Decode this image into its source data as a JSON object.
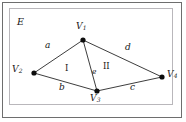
{
  "figure": {
    "region_label": "E",
    "background_color": "#ffffff",
    "line_color": "#1a1a1a",
    "outer_border_color": "#6e6e6e",
    "inner_border_color": "#b9b7bb"
  },
  "vertices": [
    {
      "id": "v1",
      "label": "V",
      "subscript": "1",
      "x": 83,
      "y": 40
    },
    {
      "id": "v2",
      "label": "V",
      "subscript": "2",
      "x": 34,
      "y": 73
    },
    {
      "id": "v3",
      "label": "V",
      "subscript": "3",
      "x": 97,
      "y": 91
    },
    {
      "id": "v4",
      "label": "V",
      "subscript": "4",
      "x": 162,
      "y": 77
    }
  ],
  "edges": [
    {
      "id": "a",
      "label": "a",
      "from": "v1",
      "to": "v2"
    },
    {
      "id": "b",
      "label": "b",
      "from": "v2",
      "to": "v3"
    },
    {
      "id": "c",
      "label": "c",
      "from": "v3",
      "to": "v4"
    },
    {
      "id": "d",
      "label": "d",
      "from": "v1",
      "to": "v4"
    },
    {
      "id": "e",
      "label": "e",
      "from": "v1",
      "to": "v3"
    }
  ],
  "faces": [
    {
      "id": "face-1",
      "label": "I"
    },
    {
      "id": "face-2",
      "label": "II"
    }
  ]
}
